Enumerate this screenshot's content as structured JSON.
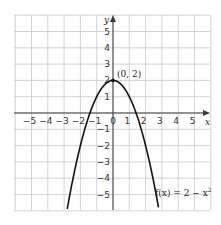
{
  "chart_data": {
    "type": "line",
    "title": "",
    "xlabel": "x",
    "ylabel": "y",
    "xlim": [
      -6,
      6
    ],
    "ylim": [
      -6,
      6
    ],
    "grid": true,
    "x_ticks": [
      "-5",
      "-4",
      "-3",
      "-2",
      "-1",
      "0",
      "1",
      "2",
      "3",
      "4",
      "5"
    ],
    "y_ticks": [
      "5",
      "4",
      "3",
      "2",
      "1",
      "-1",
      "-2",
      "-3",
      "-4",
      "-5"
    ],
    "series": [
      {
        "name": "f(x) = 2 - x²",
        "x": [
          -2.8,
          -2.5,
          -2,
          -1.5,
          -1,
          -0.5,
          0,
          0.5,
          1,
          1.5,
          2,
          2.5,
          2.8
        ],
        "y": [
          -5.84,
          -4.25,
          -2,
          -0.25,
          1,
          1.75,
          2,
          1.75,
          1,
          -0.25,
          -2,
          -4.25,
          -5.84
        ]
      }
    ],
    "annotations": [
      {
        "text": "(0, 2)",
        "x": 0,
        "y": 2
      },
      {
        "text": "f(x) = 2 − x²",
        "x": 3.2,
        "y": -4.3
      }
    ]
  },
  "labels": {
    "x_axis": "x",
    "y_axis": "y",
    "vertex": "(0, 2)",
    "function": "f(x) = 2 − x",
    "function_exp": "2"
  }
}
